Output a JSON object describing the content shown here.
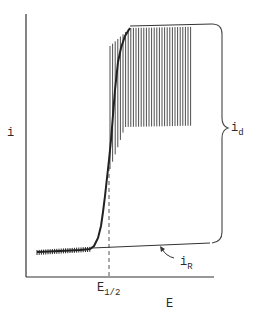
{
  "chart_data": {
    "type": "line",
    "title": "",
    "xlabel": "E",
    "ylabel": "i",
    "x_ticks": [
      "E1/2"
    ],
    "annotations": [
      {
        "text": "i_d",
        "meaning": "diffusion (limiting) current, bracket from residual line to plateau"
      },
      {
        "text": "i_R",
        "meaning": "residual current line, indicated by curved arrow"
      },
      {
        "text": "E1/2",
        "meaning": "half-wave potential, dashed vertical line"
      }
    ],
    "series": [
      {
        "name": "polarographic wave (oscillating upper envelope)",
        "x": [
          0.06,
          0.35,
          0.38,
          0.42,
          0.45,
          0.48,
          0.52,
          0.56,
          0.62,
          0.7,
          0.8,
          0.9,
          0.98
        ],
        "y": [
          0.04,
          0.06,
          0.12,
          0.28,
          0.45,
          0.7,
          0.88,
          0.94,
          0.97,
          0.98,
          0.985,
          0.99,
          1.0
        ]
      },
      {
        "name": "polarographic wave (oscillating lower envelope)",
        "x": [
          0.06,
          0.35,
          0.38,
          0.42,
          0.45,
          0.48,
          0.52,
          0.56,
          0.62,
          0.7,
          0.8,
          0.88
        ],
        "y": [
          0.0,
          0.02,
          0.08,
          0.22,
          0.4,
          0.5,
          0.56,
          0.58,
          0.6,
          0.61,
          0.61,
          0.62
        ]
      },
      {
        "name": "residual current i_R",
        "x": [
          0.35,
          0.98
        ],
        "y": [
          0.02,
          0.06
        ]
      }
    ],
    "e_half_x": 0.45,
    "grid": false,
    "legend": "none"
  },
  "labels": {
    "y_axis": "i",
    "x_axis": "E",
    "e_half_main": "E",
    "e_half_sub": "1/2",
    "id_main": "i",
    "id_sub": "d",
    "ir_main": "i",
    "ir_sub": "R"
  }
}
